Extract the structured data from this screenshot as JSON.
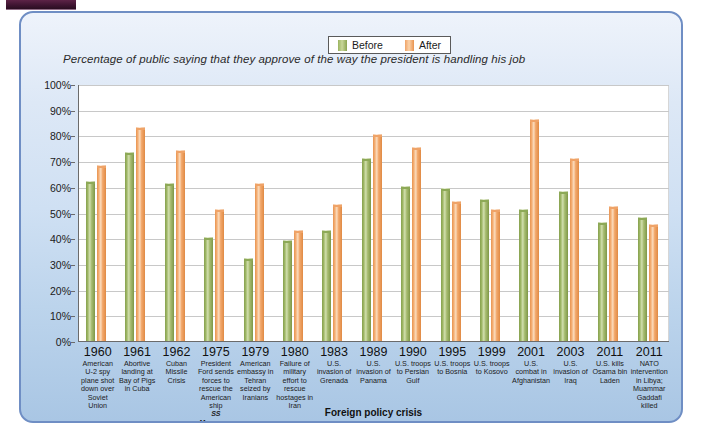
{
  "figure": {
    "title": "Percentage of public saying that they approve of the way the president is handling his job",
    "xaxis_title": "Foreign policy crisis",
    "legend": [
      {
        "label": "Before",
        "color": "#9ab35e",
        "icon": "legend-swatch-icon"
      },
      {
        "label": "After",
        "color": "#efa367",
        "icon": "legend-swatch-icon"
      }
    ],
    "panel_border_color": "#6f8ec4",
    "accent_tab_color": "#3d1430"
  },
  "chart_data": {
    "type": "bar",
    "title": "Percentage of public saying that they approve of the way the president is handling his job",
    "xlabel": "Foreign policy crisis",
    "ylabel": "",
    "ylim": [
      0,
      100
    ],
    "yticks": [
      "0%",
      "10%",
      "20%",
      "30%",
      "40%",
      "50%",
      "60%",
      "70%",
      "80%",
      "90%",
      "100%"
    ],
    "ytick_values": [
      0,
      10,
      20,
      30,
      40,
      50,
      60,
      70,
      80,
      90,
      100
    ],
    "grid": true,
    "legend_position": "top-center",
    "categories": [
      "1960 American U-2 spy plane shot down over Soviet Union",
      "1961 Abortive landing at Bay of Pigs in Cuba",
      "1962 Cuban Missile Crisis",
      "1975 President Ford sends forces to rescue the American ship SS Mayaguez",
      "1979 American embassy in Tehran seized by Iranians",
      "1980 Failure of military effort to rescue hostages in Iran",
      "1983 U.S. invasion of Grenada",
      "1989 U.S. invasion of Panama",
      "1990 U.S. troops to Persian Gulf",
      "1995 U.S. troops to Bosnia",
      "1999 U.S. troops to Kosovo",
      "2001 U.S. combat in Afghanistan",
      "2003 U.S. invasion of Iraq",
      "2011 U.S. kills Osama bin Laden",
      "2011 NATO intervention in Libya; Muammar Gaddafi killed"
    ],
    "category_parts": [
      {
        "year": "1960",
        "desc": "American U-2 spy plane shot down over Soviet Union",
        "italic": ""
      },
      {
        "year": "1961",
        "desc": "Abortive landing at Bay of Pigs in Cuba",
        "italic": ""
      },
      {
        "year": "1962",
        "desc": "Cuban Missile Crisis",
        "italic": ""
      },
      {
        "year": "1975",
        "desc": "President Ford sends forces to rescue the American ship",
        "italic": "SS Mayaguez"
      },
      {
        "year": "1979",
        "desc": "American embassy in Tehran seized by Iranians",
        "italic": ""
      },
      {
        "year": "1980",
        "desc": "Failure of military effort to rescue hostages in Iran",
        "italic": ""
      },
      {
        "year": "1983",
        "desc": "U.S. invasion of Grenada",
        "italic": ""
      },
      {
        "year": "1989",
        "desc": "U.S. invasion of Panama",
        "italic": ""
      },
      {
        "year": "1990",
        "desc": "U.S. troops to Persian Gulf",
        "italic": ""
      },
      {
        "year": "1995",
        "desc": "U.S. troops to Bosnia",
        "italic": ""
      },
      {
        "year": "1999",
        "desc": "U.S. troops to Kosovo",
        "italic": ""
      },
      {
        "year": "2001",
        "desc": "U.S. combat in Afghanistan",
        "italic": ""
      },
      {
        "year": "2003",
        "desc": "U.S. invasion of Iraq",
        "italic": ""
      },
      {
        "year": "2011",
        "desc": "U.S. kills Osama bin Laden",
        "italic": ""
      },
      {
        "year": "2011",
        "desc": "NATO intervention in Libya; Muammar Gaddafi killed",
        "italic": ""
      }
    ],
    "series": [
      {
        "name": "Before",
        "color": "#9ab35e",
        "values": [
          62,
          73,
          61,
          40,
          32,
          39,
          43,
          71,
          60,
          59,
          55,
          51,
          58,
          46,
          48
        ]
      },
      {
        "name": "After",
        "color": "#efa367",
        "values": [
          68,
          83,
          74,
          51,
          61,
          43,
          53,
          80,
          75,
          54,
          51,
          86,
          71,
          52,
          45
        ]
      }
    ]
  }
}
